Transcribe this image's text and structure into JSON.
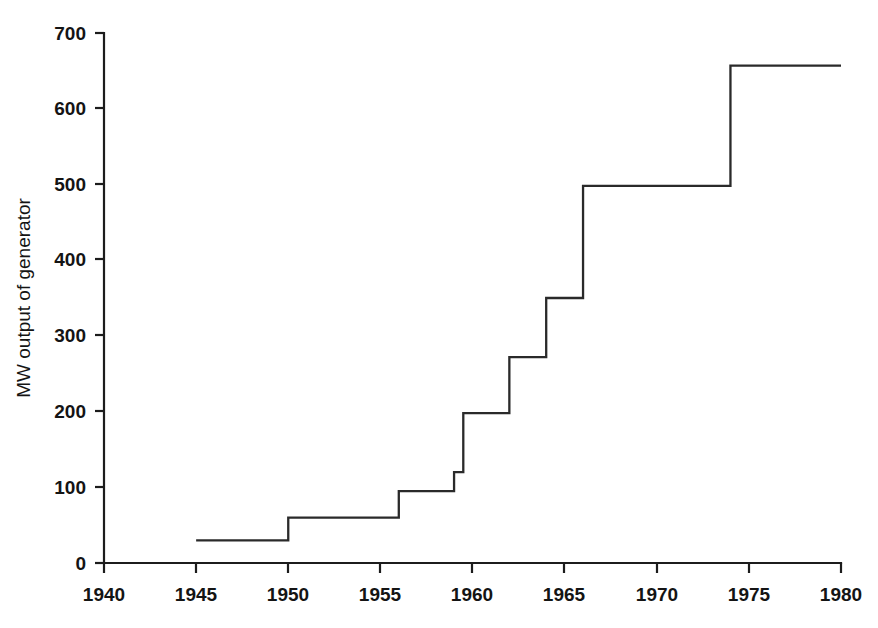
{
  "chart_data": {
    "type": "line",
    "subtype": "step-post",
    "title": "",
    "subtitle": "",
    "xlabel": "",
    "ylabel": "MW output of generator",
    "xlim": [
      1940,
      1980
    ],
    "ylim": [
      0,
      700
    ],
    "grid": false,
    "legend": null,
    "xticks": [
      1940,
      1945,
      1950,
      1955,
      1960,
      1965,
      1970,
      1975,
      1980
    ],
    "xtick_labels": [
      "1940",
      "1945",
      "1950",
      "1955",
      "1960",
      "1965",
      "1970",
      "1975",
      "1980"
    ],
    "yticks": [
      0,
      100,
      200,
      300,
      400,
      500,
      600,
      700
    ],
    "ytick_labels": [
      "0",
      "100",
      "200",
      "300",
      "400",
      "500",
      "600",
      "700"
    ],
    "line_color": "#2a2a2a",
    "background_color": "#ffffff",
    "x": [
      1945,
      1950,
      1956,
      1959,
      1959.5,
      1962,
      1964,
      1966,
      1974,
      1980
    ],
    "y": [
      30,
      60,
      95,
      120,
      198,
      272,
      350,
      498,
      657,
      657
    ],
    "series": [
      {
        "name": "MW output of generator",
        "points": [
          {
            "x": 1945,
            "y": 30
          },
          {
            "x": 1950,
            "y": 60
          },
          {
            "x": 1956,
            "y": 95
          },
          {
            "x": 1959,
            "y": 120
          },
          {
            "x": 1959.5,
            "y": 198
          },
          {
            "x": 1962,
            "y": 272
          },
          {
            "x": 1964,
            "y": 350
          },
          {
            "x": 1966,
            "y": 498
          },
          {
            "x": 1974,
            "y": 657
          },
          {
            "x": 1980,
            "y": 657
          }
        ]
      }
    ]
  },
  "figure": {
    "ylabel": "MW output of generator",
    "xlabel": "",
    "title": ""
  },
  "axes": {
    "y_labels": [
      "700",
      "600",
      "500",
      "400",
      "300",
      "200",
      "100",
      "0"
    ],
    "x_labels": [
      "1940",
      "1945",
      "1950",
      "1955",
      "1960",
      "1965",
      "1970",
      "1975",
      "1980"
    ]
  }
}
